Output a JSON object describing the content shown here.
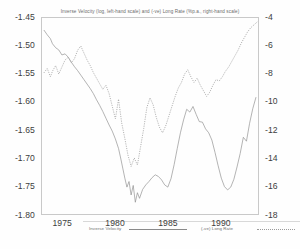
{
  "chart_data": {
    "type": "line",
    "title": "Inverse Velocity (log, left-hand scale) and (-ve) Long Rate (%p.a., right-hand scale)",
    "xlabel": "",
    "ylabel": "",
    "grid": false,
    "legend_position": "inside-bottom",
    "x_ticks": [
      "1975",
      "1980",
      "1985",
      "1990"
    ],
    "x_tick_values": [
      1975,
      1980,
      1985,
      1990
    ],
    "xlim": [
      1973.0,
      1993.6
    ],
    "left_axis": {
      "label": "Inverse Velocity (log)",
      "ticks": [
        "-1.45",
        "-1.50",
        "-1.55",
        "-1.60",
        "-1.65",
        "-1.70",
        "-1.75",
        "-1.80"
      ],
      "tick_values": [
        -1.45,
        -1.5,
        -1.55,
        -1.6,
        -1.65,
        -1.7,
        -1.75,
        -1.8
      ],
      "ylim": [
        -1.8,
        -1.45
      ]
    },
    "right_axis": {
      "label": "(-ve) Long Rate (%p.a.)",
      "ticks": [
        "-4",
        "-6",
        "-8",
        "-10",
        "-12",
        "-14",
        "-16",
        "-18"
      ],
      "tick_values": [
        -4,
        -6,
        -8,
        -10,
        -12,
        -14,
        -16,
        -18
      ],
      "ylim": [
        -18,
        -4
      ]
    },
    "series": [
      {
        "name": "Inverse Velocity",
        "axis": "left",
        "style": "solid",
        "color": "#8a8a8a",
        "x": [
          1973.2,
          1973.5,
          1973.8,
          1974.0,
          1974.3,
          1974.6,
          1974.9,
          1975.2,
          1975.5,
          1975.8,
          1976.1,
          1976.4,
          1976.7,
          1977.0,
          1977.3,
          1977.6,
          1977.9,
          1978.2,
          1978.5,
          1978.8,
          1979.1,
          1979.4,
          1979.7,
          1980.0,
          1980.3,
          1980.5,
          1980.7,
          1980.9,
          1981.1,
          1981.3,
          1981.5,
          1981.7,
          1981.9,
          1982.1,
          1982.3,
          1982.6,
          1982.9,
          1983.2,
          1983.5,
          1983.8,
          1984.1,
          1984.4,
          1984.7,
          1985.0,
          1985.3,
          1985.6,
          1985.9,
          1986.2,
          1986.5,
          1986.8,
          1987.1,
          1987.4,
          1987.7,
          1988.0,
          1988.3,
          1988.6,
          1988.9,
          1989.2,
          1989.5,
          1989.8,
          1990.1,
          1990.4,
          1990.7,
          1991.0,
          1991.3,
          1991.6,
          1991.9,
          1992.2,
          1992.5,
          1992.8,
          1993.1,
          1993.4
        ],
        "values": [
          -1.472,
          -1.48,
          -1.487,
          -1.496,
          -1.503,
          -1.507,
          -1.516,
          -1.514,
          -1.52,
          -1.529,
          -1.537,
          -1.544,
          -1.552,
          -1.56,
          -1.568,
          -1.576,
          -1.585,
          -1.596,
          -1.606,
          -1.617,
          -1.629,
          -1.641,
          -1.652,
          -1.666,
          -1.683,
          -1.7,
          -1.718,
          -1.736,
          -1.752,
          -1.742,
          -1.766,
          -1.749,
          -1.779,
          -1.762,
          -1.772,
          -1.756,
          -1.748,
          -1.742,
          -1.735,
          -1.73,
          -1.733,
          -1.739,
          -1.748,
          -1.752,
          -1.737,
          -1.712,
          -1.683,
          -1.655,
          -1.632,
          -1.613,
          -1.618,
          -1.608,
          -1.622,
          -1.635,
          -1.636,
          -1.648,
          -1.655,
          -1.668,
          -1.69,
          -1.714,
          -1.736,
          -1.751,
          -1.757,
          -1.752,
          -1.738,
          -1.716,
          -1.692,
          -1.663,
          -1.67,
          -1.638,
          -1.612,
          -1.592
        ]
      },
      {
        "name": "(-ve) Long Rate",
        "axis": "right",
        "style": "dotted",
        "color": "#9a9a9a",
        "x": [
          1973.2,
          1973.5,
          1973.8,
          1974.0,
          1974.3,
          1974.6,
          1974.9,
          1975.2,
          1975.5,
          1975.8,
          1976.1,
          1976.4,
          1976.7,
          1977.0,
          1977.3,
          1977.6,
          1977.9,
          1978.2,
          1978.5,
          1978.8,
          1979.1,
          1979.4,
          1979.7,
          1980.0,
          1980.3,
          1980.6,
          1980.9,
          1981.2,
          1981.5,
          1981.8,
          1982.1,
          1982.4,
          1982.7,
          1983.0,
          1983.3,
          1983.6,
          1983.9,
          1984.2,
          1984.5,
          1984.8,
          1985.1,
          1985.4,
          1985.7,
          1986.0,
          1986.3,
          1986.6,
          1986.9,
          1987.2,
          1987.5,
          1987.8,
          1988.1,
          1988.4,
          1988.7,
          1989.0,
          1989.3,
          1989.6,
          1989.9,
          1990.2,
          1990.5,
          1990.8,
          1991.1,
          1991.4,
          1991.7,
          1992.0,
          1992.3,
          1992.6,
          1992.9,
          1993.2,
          1993.5
        ],
        "values": [
          -7.9,
          -7.6,
          -8.2,
          -7.8,
          -7.4,
          -8.0,
          -7.5,
          -7.0,
          -6.8,
          -7.2,
          -6.9,
          -6.3,
          -6.0,
          -6.5,
          -7.0,
          -7.4,
          -7.9,
          -8.3,
          -8.7,
          -9.1,
          -8.8,
          -9.4,
          -10.3,
          -11.2,
          -9.8,
          -11.5,
          -12.6,
          -13.8,
          -14.6,
          -14.0,
          -14.5,
          -13.2,
          -11.9,
          -10.4,
          -9.7,
          -10.2,
          -11.1,
          -11.8,
          -12.2,
          -11.7,
          -11.0,
          -10.3,
          -9.6,
          -9.0,
          -8.6,
          -8.0,
          -7.7,
          -8.2,
          -8.6,
          -8.3,
          -8.8,
          -9.2,
          -9.6,
          -9.3,
          -8.8,
          -8.4,
          -8.5,
          -8.2,
          -7.8,
          -7.5,
          -7.1,
          -6.7,
          -6.3,
          -5.8,
          -5.4,
          -5.0,
          -4.7,
          -4.5,
          -4.3
        ]
      }
    ]
  },
  "legend": {
    "velocity_label": "Inverse Velocity",
    "longrate_label": "(-ve) Long Rate"
  }
}
